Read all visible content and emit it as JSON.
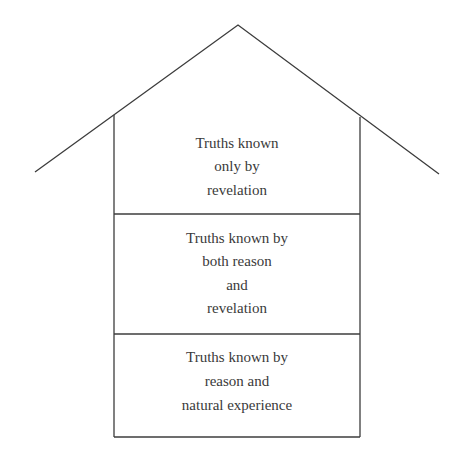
{
  "diagram": {
    "type": "house-of-knowledge",
    "sections": [
      {
        "position": "top (under roof)",
        "lines": [
          "Truths known",
          "only by",
          "revelation"
        ]
      },
      {
        "position": "middle",
        "lines": [
          "Truths known by",
          "both reason",
          "and",
          "revelation"
        ]
      },
      {
        "position": "bottom (foundation)",
        "lines": [
          "Truths known by",
          "reason and",
          "natural experience"
        ]
      }
    ]
  }
}
